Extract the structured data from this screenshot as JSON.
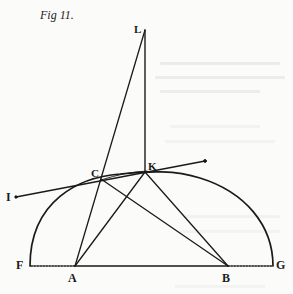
{
  "figure": {
    "title": "Fig 11.",
    "labels": {
      "L": "L",
      "C": "C",
      "K": "K",
      "I": "I",
      "F": "F",
      "A": "A",
      "B": "B",
      "G": "G"
    },
    "points": {
      "L": [
        145,
        30
      ],
      "K": [
        145,
        172
      ],
      "C": [
        101,
        179
      ],
      "I": [
        15,
        197
      ],
      "A": [
        75,
        266
      ],
      "B": [
        228,
        266
      ],
      "F": [
        30,
        266
      ],
      "G": [
        273,
        266
      ],
      "tangent_end": [
        205,
        161
      ]
    },
    "segments": [
      [
        "L",
        "K"
      ],
      [
        "L",
        "A"
      ],
      [
        "C",
        "B"
      ],
      [
        "K",
        "A"
      ],
      [
        "K",
        "B"
      ],
      [
        "A",
        "B"
      ],
      [
        "I",
        "tangent_end"
      ]
    ],
    "dotted_segments": [
      [
        "F",
        "A"
      ],
      [
        "B",
        "G"
      ]
    ],
    "arc": {
      "from": "F",
      "to": "G",
      "through": [
        "C",
        "K"
      ]
    },
    "colors": {
      "ink": "#1a1a1a",
      "paper": "#fbfbfa"
    }
  }
}
